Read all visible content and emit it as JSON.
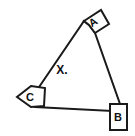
{
  "figure": {
    "background_color": "#ffffff",
    "line_color": "#1a1a1a",
    "text_color": "#111111",
    "interior_label": "X.",
    "vertices": [
      {
        "id": "A",
        "label": "A",
        "position": "top-right",
        "tab_style": "tilted-quadrilateral",
        "x": 93,
        "y": 22
      },
      {
        "id": "B",
        "label": "B",
        "position": "bottom-right",
        "tab_style": "upright-rectangle",
        "x": 118,
        "y": 120
      },
      {
        "id": "C",
        "label": "C",
        "position": "left",
        "tab_style": "left-pointing-pentagon",
        "x": 27,
        "y": 96
      }
    ],
    "edges": [
      {
        "id": "edge-ca",
        "from": "C",
        "to": "A"
      },
      {
        "id": "edge-ab",
        "from": "A",
        "to": "B"
      },
      {
        "id": "edge-bc",
        "from": "B",
        "to": "C"
      }
    ],
    "interior_point": {
      "id": "X",
      "label": "X.",
      "x": 62,
      "y": 72
    }
  }
}
